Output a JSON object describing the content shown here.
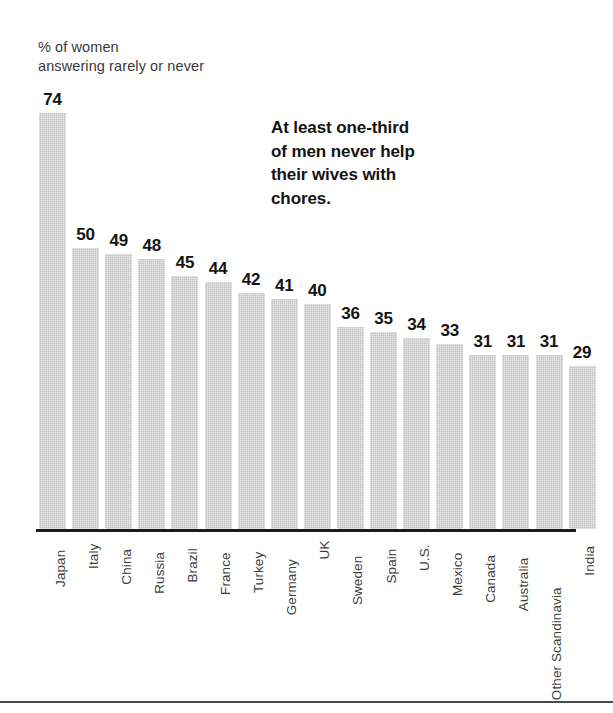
{
  "subtitle": "% of women\nanswering rarely or never",
  "annotation": "At least one-third of men never help their wives with chores.",
  "footer_rule": true,
  "colors": {
    "bar_fill": "#c6c6c6",
    "axis": "#1b1b1b",
    "value_text": "#141414",
    "label_text": "#3d3d3d",
    "subtitle_text": "#3a3a3a",
    "background": "#ffffff"
  },
  "chart_data": {
    "type": "bar",
    "title": "",
    "subtitle": "% of women answering rarely or never",
    "xlabel": "",
    "ylabel": "% of women answering rarely or never",
    "ylim": [
      0,
      74
    ],
    "grid": false,
    "legend": false,
    "orientation": "vertical",
    "annotations": [
      {
        "text": "At least one-third of men never help their wives with chores.",
        "position": "inside-plot-upper-middle"
      }
    ],
    "categories": [
      "Japan",
      "Italy",
      "China",
      "Russia",
      "Brazil",
      "France",
      "Turkey",
      "Germany",
      "UK",
      "Sweden",
      "Spain",
      "U.S.",
      "Mexico",
      "Canada",
      "Australia",
      "Other Scandinavia",
      "India"
    ],
    "values": [
      74,
      50,
      49,
      48,
      45,
      44,
      42,
      41,
      40,
      36,
      35,
      34,
      33,
      31,
      31,
      31,
      29
    ],
    "value_labels": [
      "74",
      "50",
      "49",
      "48",
      "45",
      "44",
      "42",
      "41",
      "40",
      "36",
      "35",
      "34",
      "33",
      "31",
      "31",
      "31",
      "29"
    ]
  }
}
